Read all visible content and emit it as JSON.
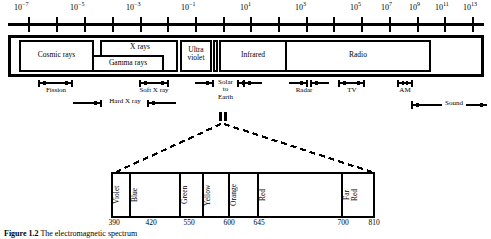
{
  "figure": {
    "caption_number": "Figure 1.2",
    "caption_text": "The electromagnetic spectrum"
  },
  "axis": {
    "name": "wavelength-decade-axis",
    "tick_labels": [
      {
        "text": "10",
        "exp": "−7",
        "x": 23
      },
      {
        "text": "10",
        "exp": "−5",
        "x": 78
      },
      {
        "text": "10",
        "exp": "−3",
        "x": 134
      },
      {
        "text": "10",
        "exp": "−1",
        "x": 189
      },
      {
        "text": "10",
        "exp": "1",
        "x": 244
      },
      {
        "text": "10",
        "exp": "3",
        "x": 299
      },
      {
        "text": "10",
        "exp": "5",
        "x": 354
      },
      {
        "text": "10",
        "exp": "7",
        "x": 385
      },
      {
        "text": "10",
        "exp": "9",
        "x": 413
      },
      {
        "text": "10",
        "exp": "11",
        "x": 441
      },
      {
        "text": "10",
        "exp": "13",
        "x": 469
      }
    ]
  },
  "bands": [
    {
      "name": "cosmic-rays",
      "label": "Cosmic rays"
    },
    {
      "name": "x-rays",
      "label": "X rays"
    },
    {
      "name": "gamma-rays",
      "label": "Gamma rays"
    },
    {
      "name": "ultraviolet",
      "label": "Ultra\nviolet"
    },
    {
      "name": "infrared",
      "label": "Infrared"
    },
    {
      "name": "radio",
      "label": "Radio"
    }
  ],
  "annotations": [
    {
      "name": "fission",
      "label": "Fission"
    },
    {
      "name": "hard-x-ray",
      "label": "Hard X ray"
    },
    {
      "name": "soft-x-ray",
      "label": "Soft X ray"
    },
    {
      "name": "solar-to-earth",
      "label": "Solar\nto\nEarth"
    },
    {
      "name": "radar",
      "label": "Radar"
    },
    {
      "name": "tv",
      "label": "TV"
    },
    {
      "name": "am",
      "label": "AM"
    },
    {
      "name": "sound",
      "label": "Sound"
    }
  ],
  "visible_spectrum": {
    "colors": [
      {
        "name": "violet",
        "label": "Violet"
      },
      {
        "name": "blue",
        "label": "Blue"
      },
      {
        "name": "green",
        "label": "Green"
      },
      {
        "name": "yellow",
        "label": "Yellow"
      },
      {
        "name": "orange",
        "label": "Orange"
      },
      {
        "name": "red",
        "label": "Red"
      },
      {
        "name": "far-red",
        "label": "Far\nRed"
      }
    ],
    "wavelengths": [
      "390",
      "420",
      "550",
      "600",
      "645",
      "700",
      "810"
    ]
  }
}
